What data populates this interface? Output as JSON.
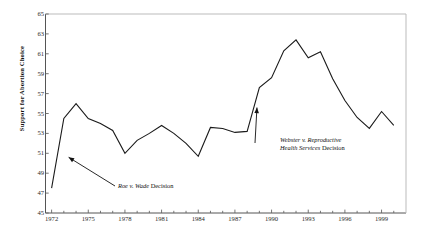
{
  "chart_data": {
    "type": "line",
    "title": "",
    "xlabel": "",
    "ylabel": "Support for Abortion Choice",
    "xlim": [
      1971.5,
      2001.0
    ],
    "ylim": [
      45,
      65
    ],
    "ytick_step": 2,
    "yticks": [
      45,
      47,
      49,
      51,
      53,
      55,
      57,
      59,
      61,
      63,
      65
    ],
    "xticks_major": [
      1972,
      1975,
      1978,
      1981,
      1984,
      1987,
      1990,
      1993,
      1996,
      1999
    ],
    "xticks_minor_every": 1,
    "grid": false,
    "legend": null,
    "line_color": "#1a1a1a",
    "series": [
      {
        "name": "Support for Abortion Choice",
        "x": [
          1972,
          1973,
          1974,
          1975,
          1976,
          1977,
          1978,
          1979,
          1980,
          1981,
          1982,
          1983,
          1984,
          1985,
          1986,
          1987,
          1988,
          1989,
          1990,
          1991,
          1992,
          1993,
          1994,
          1995,
          1996,
          1997,
          1998,
          1999,
          2000
        ],
        "values": [
          47.5,
          54.5,
          56.0,
          54.5,
          54.0,
          53.3,
          51.0,
          52.3,
          53.0,
          53.8,
          53.0,
          52.0,
          50.7,
          53.6,
          53.5,
          53.1,
          53.2,
          57.6,
          58.6,
          61.3,
          62.4,
          60.6,
          61.2,
          58.5,
          56.3,
          54.6,
          53.5,
          55.2,
          53.8
        ]
      }
    ],
    "annotations": [
      {
        "id": "roe-annotation",
        "text_italic": "Roe v. Wade",
        "text_plain": " Decision",
        "points_to_year": 1972,
        "points_to_value": 50.6
      },
      {
        "id": "webster-annotation",
        "text_line1_italic": "Webster v. Reproductive",
        "text_line2_italic": "Health Services",
        "text_line2_plain": " Decision",
        "points_to_year": 1988.6,
        "points_to_value": 55.5
      }
    ]
  }
}
